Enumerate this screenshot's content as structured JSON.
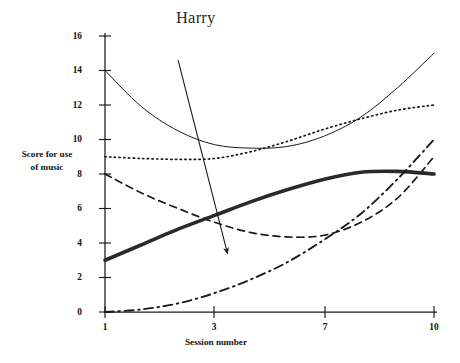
{
  "chart_data": {
    "type": "line",
    "title": "Harry",
    "xlabel": "Session number",
    "ylabel": "Score for use of music",
    "ylabel_lines": [
      "Score for use",
      "of music"
    ],
    "xlim": [
      1,
      10
    ],
    "ylim": [
      0,
      16
    ],
    "grid": false,
    "legend": "none",
    "x_ticks": [
      1,
      3,
      7,
      10
    ],
    "x_tick_labels": [
      "1",
      "3",
      "7",
      "10"
    ],
    "y_ticks": [
      0,
      2,
      4,
      6,
      8,
      10,
      12,
      14,
      16
    ],
    "y_tick_labels": [
      "0",
      "2",
      "4",
      "6",
      "8",
      "10",
      "12",
      "14",
      "16"
    ],
    "x": [
      1,
      2,
      3,
      4,
      5,
      6,
      7,
      8,
      9,
      10
    ],
    "series": [
      {
        "name": "solid-thin-curve",
        "style": "solid",
        "width": 1,
        "color": "#1a1a1a",
        "values": [
          14.0,
          11.9,
          10.5,
          9.7,
          9.5,
          9.6,
          10.2,
          11.3,
          13.0,
          15.0
        ]
      },
      {
        "name": "dotted-curve",
        "style": "dotted",
        "width": 1.7,
        "color": "#1a1a1a",
        "values": [
          9.0,
          8.9,
          8.85,
          8.9,
          9.3,
          9.9,
          10.6,
          11.2,
          11.7,
          12.0
        ]
      },
      {
        "name": "dashed-curve",
        "style": "dashed",
        "width": 1.7,
        "color": "#1a1a1a",
        "values": [
          8.0,
          6.9,
          6.0,
          5.2,
          4.6,
          4.35,
          4.45,
          5.2,
          6.6,
          9.0
        ]
      },
      {
        "name": "thick-solid-curve",
        "style": "solid",
        "width": 3.6,
        "color": "#2a2a2a",
        "values": [
          3.0,
          3.9,
          4.8,
          5.6,
          6.4,
          7.1,
          7.7,
          8.1,
          8.15,
          8.0
        ]
      },
      {
        "name": "dash-dot-curve",
        "style": "dashdot",
        "width": 1.9,
        "color": "#1a1a1a",
        "values": [
          0.0,
          0.15,
          0.5,
          1.1,
          1.9,
          2.9,
          4.2,
          5.7,
          7.7,
          10.0
        ]
      }
    ],
    "annotations": [
      {
        "name": "harry-arrow",
        "type": "arrow",
        "from": [
          3.0,
          14.6
        ],
        "to": [
          4.35,
          3.4
        ]
      }
    ]
  }
}
